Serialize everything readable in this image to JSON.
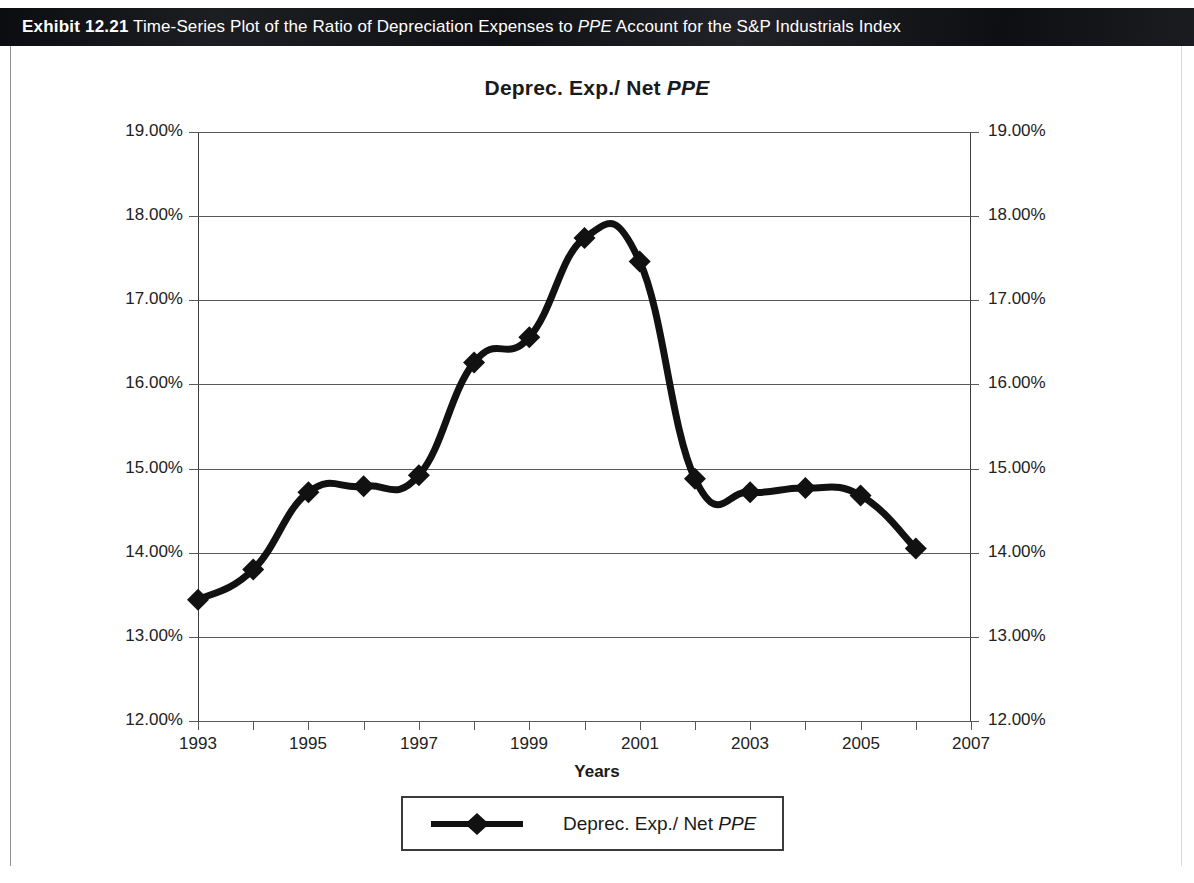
{
  "exhibit": {
    "number_label": "Exhibit 12.21",
    "caption_before": "Time-Series Plot of the Ratio of Depreciation Expenses to ",
    "caption_italic": "PPE",
    "caption_after": " Account for the S&P Industrials Index"
  },
  "figure": {
    "title_plain": "Deprec. Exp./ Net ",
    "title_italic": "PPE",
    "legend": {
      "label_plain": "Deprec. Exp./ Net ",
      "label_italic": "PPE",
      "marker": "line-with-diamond-marker"
    }
  },
  "colors": {
    "series": "#111111",
    "gridline": "#58595b",
    "axis": "#3c3d3f",
    "band_background": "#15161a",
    "band_text": "#ffffff"
  },
  "chart_data": {
    "type": "line",
    "title": "Deprec. Exp./ Net PPE",
    "xlabel": "Years",
    "ylabel": "",
    "xlim": [
      1993,
      2007
    ],
    "ylim": [
      12.0,
      19.0
    ],
    "grid": true,
    "legend_position": "bottom",
    "y_tick_labels": [
      "19.00%",
      "18.00%",
      "17.00%",
      "16.00%",
      "15.00%",
      "14.00%",
      "13.00%",
      "12.00%"
    ],
    "y_ticks": [
      19.0,
      18.0,
      17.0,
      16.0,
      15.0,
      14.0,
      13.0,
      12.0
    ],
    "y_axis_right_tick_labels": [
      "19.00%",
      "18.00%",
      "17.00%",
      "16.00%",
      "15.00%",
      "14.00%",
      "13.00%",
      "12.00%"
    ],
    "x_tick_labels": [
      "1993",
      "1995",
      "1997",
      "1999",
      "2001",
      "2003",
      "2005",
      "2007"
    ],
    "x_ticks": [
      1993,
      1995,
      1997,
      1999,
      2001,
      2003,
      2005,
      2007
    ],
    "x_minor_ticks": [
      1994,
      1996,
      1998,
      2000,
      2002,
      2004,
      2006
    ],
    "series": [
      {
        "name": "Deprec. Exp./ Net PPE",
        "marker": "diamond",
        "x": [
          1993,
          1994,
          1995,
          1996,
          1997,
          1998,
          1999,
          2000,
          2001,
          2002,
          2003,
          2004,
          2005,
          2006
        ],
        "values": [
          13.44,
          13.8,
          14.72,
          14.79,
          14.92,
          16.26,
          16.56,
          17.74,
          17.46,
          14.88,
          14.72,
          14.77,
          14.68,
          14.05
        ]
      }
    ]
  }
}
